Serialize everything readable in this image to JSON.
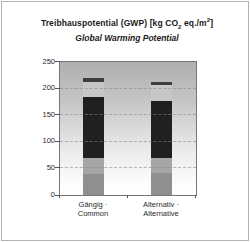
{
  "header": {
    "title_parts": {
      "prefix": "Treibhauspotential (GWP) [kg CO",
      "co_subscript": "2",
      "mid": " eq./m",
      "exponent": "2",
      "suffix": "]"
    },
    "subtitle": "Global Warming Potential"
  },
  "chart_data": {
    "type": "bar",
    "stacked": true,
    "subtitle": "Global Warming Potential",
    "categories": [
      "Gängig · Common",
      "Alternativ · Alternative"
    ],
    "label_lines": [
      [
        "Gängig ·",
        "Common"
      ],
      [
        "Alternativ ·",
        "Alternative"
      ]
    ],
    "series": [
      {
        "name": "bottom-gray",
        "color": "#8f8f8f",
        "values": [
          40,
          41
        ]
      },
      {
        "name": "mid-gray",
        "color": "#a6a6a6",
        "values": [
          30,
          29
        ]
      },
      {
        "name": "black",
        "color": "#211f1f",
        "values": [
          114,
          106
        ]
      },
      {
        "name": "light-gray",
        "color": "#c7c7c7",
        "values": [
          29,
          30
        ]
      },
      {
        "name": "dark-cap",
        "color": "#3d3d3d",
        "values": [
          7,
          7
        ]
      }
    ],
    "totals": [
      220,
      213
    ],
    "xlabel": "",
    "ylabel": "",
    "ylim": [
      0,
      250
    ],
    "yticks": [
      0,
      50,
      100,
      150,
      200,
      250
    ],
    "grid": "dashed horizontal",
    "legend_position": "none",
    "plot_background": {
      "top": "#aeaeae",
      "bottom": "#ffffff"
    }
  }
}
